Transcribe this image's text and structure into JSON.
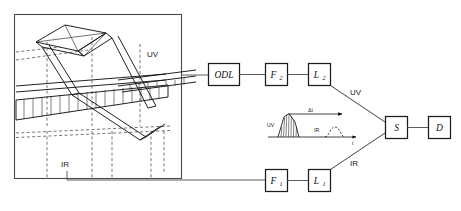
{
  "figure": {
    "background_color": "#ffffff",
    "line_color": "#1c1c1c",
    "wire_color": "#5d5d5d"
  },
  "left_panel": {
    "name": "optical-layout-panel",
    "beam_labels": {
      "uv": "UV",
      "ir": "IR"
    }
  },
  "uv_path": {
    "label": "UV",
    "boxes": [
      {
        "id": "odl",
        "label": "ODL",
        "sub": ""
      },
      {
        "id": "f2",
        "label": "F",
        "sub": "2"
      },
      {
        "id": "l2",
        "label": "L",
        "sub": "2"
      }
    ]
  },
  "ir_path": {
    "label": "IR",
    "boxes": [
      {
        "id": "f1",
        "label": "F",
        "sub": "1"
      },
      {
        "id": "l1",
        "label": "L",
        "sub": "1"
      }
    ]
  },
  "detection": {
    "boxes": [
      {
        "id": "s",
        "label": "S",
        "sub": ""
      },
      {
        "id": "d",
        "label": "D",
        "sub": ""
      }
    ]
  },
  "inset": {
    "name": "pulse-timing-inset",
    "uv_pulse_label": "UV",
    "ir_pulse_label": "IR",
    "delay_label": "Δt",
    "time_axis_label": "t"
  }
}
